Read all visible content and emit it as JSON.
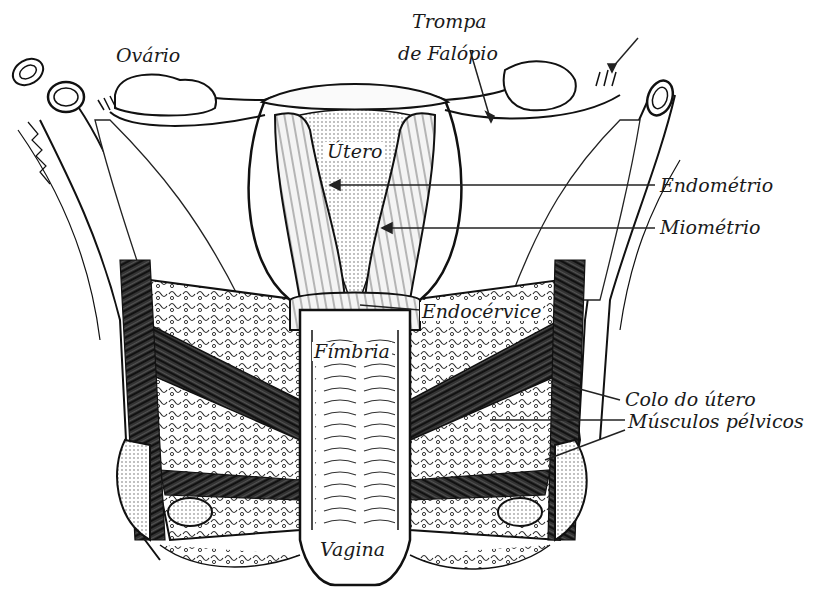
{
  "diagram": {
    "colors": {
      "ink": "#1a1a1a",
      "background": "#ffffff",
      "muscle": "#2a2a2a"
    },
    "labels": {
      "ovario": "Ovário",
      "trompa_line1": "Trompa",
      "trompa_line2": "de Falópio",
      "utero": "Útero",
      "endometrio": "Endométrio",
      "miometrio": "Miométrio",
      "endocervice": "Endocérvice",
      "fimbria": "Fímbria",
      "colo_do_utero": "Colo do útero",
      "musculos_pelvicos": "Músculos pélvicos",
      "vagina": "Vagina"
    }
  }
}
